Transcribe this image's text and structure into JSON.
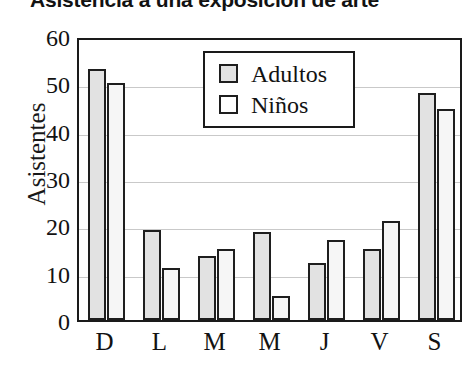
{
  "chart_data": {
    "type": "bar",
    "title": "Asistencia a una exposición de arte",
    "xlabel": "",
    "ylabel": "Asistentes",
    "categories": [
      "D",
      "L",
      "M",
      "M",
      "J",
      "V",
      "S"
    ],
    "series": [
      {
        "name": "Adultos",
        "values": [
          53,
          19,
          13.5,
          18.5,
          12,
          15,
          48
        ],
        "fill": "#e2e2e2"
      },
      {
        "name": "Niños",
        "values": [
          50,
          11,
          15,
          5,
          17,
          21,
          44.5
        ],
        "fill": "#f6f6f6"
      }
    ],
    "ylim": [
      0,
      60
    ],
    "yticks": [
      60,
      50,
      40,
      30,
      20,
      10,
      0
    ],
    "grid": true,
    "legend_position": "upper center inside"
  },
  "legend": {
    "items": [
      {
        "label": "Adultos"
      },
      {
        "label": "Niños"
      }
    ]
  }
}
